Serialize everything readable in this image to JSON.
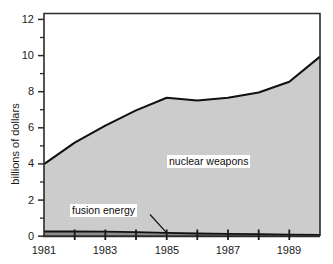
{
  "chart_data": {
    "type": "area",
    "title": "",
    "subtitle": "",
    "xlabel": "",
    "ylabel": "billions of dollars",
    "stacked": true,
    "grid": false,
    "legend_position": "inline-annotations",
    "xlim": [
      1981,
      1990
    ],
    "ylim": [
      0,
      12.4
    ],
    "y_ticks_major": [
      0,
      2,
      4,
      6,
      8,
      10,
      12
    ],
    "y_ticks_minor": [
      1,
      3,
      5,
      7,
      9,
      11
    ],
    "y_tick_labels": [
      "0",
      "2",
      "4",
      "6",
      "8",
      "10",
      "12"
    ],
    "x_ticks": [
      1981,
      1982,
      1983,
      1984,
      1985,
      1986,
      1987,
      1988,
      1989,
      1990
    ],
    "x_tick_labels_shown": [
      "1981",
      "1983",
      "1985",
      "1987",
      "1989"
    ],
    "x": [
      1981,
      1982,
      1983,
      1984,
      1985,
      1986,
      1987,
      1988,
      1989,
      1990
    ],
    "series": [
      {
        "name": "fusion energy",
        "values": [
          0.25,
          0.25,
          0.24,
          0.22,
          0.18,
          0.14,
          0.12,
          0.1,
          0.08,
          0.06
        ],
        "color": "#8c8c8c"
      },
      {
        "name": "nuclear weapons",
        "values": [
          3.75,
          4.95,
          5.91,
          6.78,
          7.52,
          7.41,
          7.58,
          7.9,
          8.52,
          9.94
        ],
        "color": "#cccccc"
      }
    ],
    "cumulative_top": [
      4.0,
      5.2,
      6.15,
      7.0,
      7.7,
      7.55,
      7.7,
      8.0,
      8.6,
      10.0
    ],
    "annotations": [
      {
        "text": "nuclear weapons",
        "target_series": "nuclear weapons",
        "boxed": true
      },
      {
        "text": "fusion energy",
        "target_series": "fusion energy",
        "boxed": true,
        "leader_line": true
      }
    ]
  },
  "axes": {
    "y_label": "billions of dollars",
    "y_ticks": [
      {
        "value": 12,
        "label": "12"
      },
      {
        "value": 10,
        "label": "10"
      },
      {
        "value": 8,
        "label": "8"
      },
      {
        "value": 6,
        "label": "6"
      },
      {
        "value": 4,
        "label": "4"
      },
      {
        "value": 2,
        "label": "2"
      },
      {
        "value": 0,
        "label": "0"
      }
    ],
    "x_ticks": [
      {
        "value": 1981,
        "label": "1981"
      },
      {
        "value": 1983,
        "label": "1983"
      },
      {
        "value": 1985,
        "label": "1985"
      },
      {
        "value": 1987,
        "label": "1987"
      },
      {
        "value": 1989,
        "label": "1989"
      }
    ]
  },
  "labels": {
    "nuclear": "nuclear weapons",
    "fusion": "fusion energy"
  },
  "colors": {
    "nuclear_fill": "#cccccc",
    "fusion_fill": "#8c8c8c",
    "line": "#111111",
    "axis": "#2b2b2b",
    "background": "#ffffff",
    "text": "#1a1a1a"
  }
}
